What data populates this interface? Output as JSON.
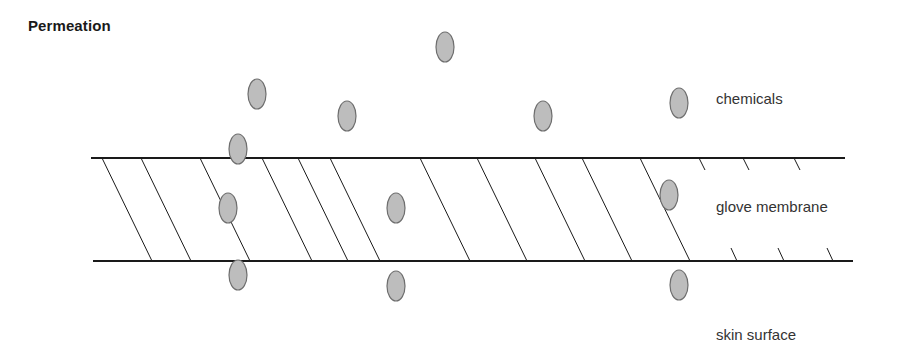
{
  "title": "Permeation",
  "labels": {
    "chemicals": "chemicals",
    "glove_membrane": "glove membrane",
    "skin_surface": "skin surface"
  },
  "colors": {
    "line": "#1a1a1a",
    "particle_fill": "#bdbdbd",
    "particle_stroke": "#6e6e6e",
    "text": "#333333"
  },
  "membrane": {
    "top_line": {
      "x1": 91,
      "x2": 845,
      "y": 158
    },
    "bottom_line": {
      "x1": 93,
      "x2": 853,
      "y": 261
    },
    "full_hatch_tops_x": [
      102,
      141,
      200,
      262,
      298,
      330,
      420,
      477,
      535,
      582,
      640
    ],
    "partial_hatch_top_x": [
      699,
      743,
      794
    ],
    "partial_hatch_bottom_x": [
      737,
      784,
      833
    ]
  },
  "particles": {
    "above": [
      {
        "cx": 445,
        "cy": 47
      },
      {
        "cx": 257,
        "cy": 94
      },
      {
        "cx": 347,
        "cy": 116
      },
      {
        "cx": 543,
        "cy": 116
      },
      {
        "cx": 679,
        "cy": 103
      }
    ],
    "in_top_line": [
      {
        "cx": 238,
        "cy": 149
      }
    ],
    "in_membrane": [
      {
        "cx": 228,
        "cy": 208
      },
      {
        "cx": 396,
        "cy": 208
      },
      {
        "cx": 669,
        "cy": 195
      }
    ],
    "at_bottom_line": [
      {
        "cx": 238,
        "cy": 275
      }
    ],
    "below": [
      {
        "cx": 396,
        "cy": 286
      },
      {
        "cx": 679,
        "cy": 285
      }
    ]
  }
}
